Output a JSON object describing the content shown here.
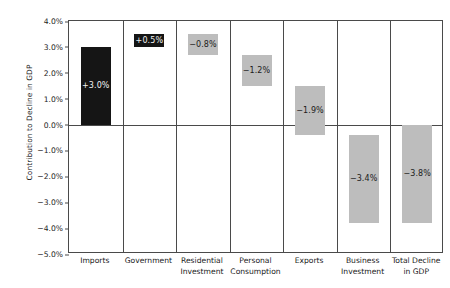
{
  "chart_data": {
    "type": "bar",
    "subtype": "waterfall",
    "title": "",
    "xlabel": "",
    "ylabel": "Contribution to Decline in GDP",
    "ylim": [
      -5.0,
      4.0
    ],
    "ytick_labels": [
      "4.0%",
      "3.0%",
      "2.0%",
      "1.0%",
      "0.0%",
      "-1.0%",
      "-2.0%",
      "-3.0%",
      "-4.0%",
      "-5.0%"
    ],
    "ytick_values": [
      4.0,
      3.0,
      2.0,
      1.0,
      0.0,
      -1.0,
      -2.0,
      -3.0,
      -4.0,
      -5.0
    ],
    "grid": false,
    "legend": "none",
    "zero_line": 0.0,
    "categories": [
      "Imports",
      "Government",
      "Residential Investment",
      "Personal Consumption",
      "Exports",
      "Business Investment",
      "Total Decline in GDP"
    ],
    "values": [
      3.0,
      0.5,
      -0.8,
      -1.2,
      -1.9,
      -3.4,
      -3.8
    ],
    "data_labels": [
      "+3.0%",
      "+0.5%",
      "-0.8%",
      "-1.2%",
      "-1.9%",
      "-3.4%",
      "-3.8%"
    ],
    "bars": [
      {
        "category": "Imports",
        "label_lines": [
          "Imports"
        ],
        "value": 3.0,
        "data_label": "+3.0%",
        "base": 0.0,
        "top": 3.0,
        "color": "#151515",
        "style": "dark"
      },
      {
        "category": "Government",
        "label_lines": [
          "Government"
        ],
        "value": 0.5,
        "data_label": "+0.5%",
        "base": 3.0,
        "top": 3.5,
        "color": "#151515",
        "style": "dark"
      },
      {
        "category": "Residential Investment",
        "label_lines": [
          "Residential",
          "Investment"
        ],
        "value": -0.8,
        "data_label": "-0.8%",
        "base": 3.5,
        "top": 2.7,
        "color": "#bdbdbd",
        "style": "light"
      },
      {
        "category": "Personal Consumption",
        "label_lines": [
          "Personal",
          "Consumption"
        ],
        "value": -1.2,
        "data_label": "-1.2%",
        "base": 2.7,
        "top": 1.5,
        "color": "#bdbdbd",
        "style": "light"
      },
      {
        "category": "Exports",
        "label_lines": [
          "Exports"
        ],
        "value": -1.9,
        "data_label": "-1.9%",
        "base": 1.5,
        "top": -0.4,
        "color": "#bdbdbd",
        "style": "light"
      },
      {
        "category": "Business Investment",
        "label_lines": [
          "Business",
          "Investment"
        ],
        "value": -3.4,
        "data_label": "-3.4%",
        "base": -0.4,
        "top": -3.8,
        "color": "#bdbdbd",
        "style": "light"
      },
      {
        "category": "Total Decline in GDP",
        "label_lines": [
          "Total Decline",
          "in GDP"
        ],
        "value": -3.8,
        "data_label": "-3.8%",
        "base": 0.0,
        "top": -3.8,
        "color": "#bdbdbd",
        "style": "light"
      }
    ],
    "colors": {
      "positive": "#151515",
      "negative": "#bdbdbd",
      "axis": "#4a4a4a",
      "background": "#ffffff",
      "text": "#1b1b1b"
    }
  }
}
